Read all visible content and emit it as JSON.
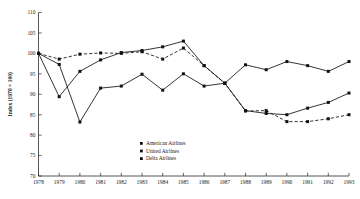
{
  "chart_data": {
    "type": "line",
    "title": "",
    "xlabel": "",
    "ylabel": "Index (1978 = 100)",
    "ylim": [
      70,
      110
    ],
    "ytick_step": 5,
    "yticks": [
      70,
      75,
      80,
      85,
      90,
      95,
      100,
      105,
      110
    ],
    "grid": false,
    "legend_position": "inside-bottom-center",
    "categories": [
      "1978",
      "1979",
      "1980",
      "1981",
      "1982",
      "1983",
      "1984",
      "1985",
      "1986",
      "1987",
      "1988",
      "1989",
      "1990",
      "1991",
      "1992",
      "1993"
    ],
    "x": [
      1978,
      1979,
      1980,
      1981,
      1982,
      1983,
      1984,
      1985,
      1986,
      1987,
      1988,
      1989,
      1990,
      1991,
      1992,
      1993
    ],
    "series": [
      {
        "name": "American Airlines",
        "marker": "square",
        "linestyle": "solid",
        "color": "#111111",
        "values": [
          100.0,
          89.4,
          95.6,
          98.4,
          100.2,
          100.7,
          101.6,
          103.0,
          97.0,
          92.7,
          97.2,
          96.0,
          98.0,
          97.0,
          95.6,
          98.0
        ]
      },
      {
        "name": "United Airlines",
        "marker": "square",
        "linestyle": "solid",
        "color": "#111111",
        "values": [
          100.0,
          97.3,
          83.2,
          91.5,
          92.0,
          94.9,
          91.0,
          95.0,
          92.0,
          92.7,
          86.0,
          85.3,
          85.0,
          86.6,
          88.0,
          90.3
        ]
      },
      {
        "name": "Delta Airlines",
        "marker": "square",
        "linestyle": "dashed",
        "color": "#111111",
        "values": [
          100.0,
          98.6,
          99.8,
          100.1,
          100.0,
          100.4,
          98.6,
          101.3,
          97.0,
          92.7,
          85.9,
          86.0,
          83.3,
          83.3,
          84.0,
          85.0
        ]
      }
    ],
    "legend": [
      "American Airlines",
      "United Airlines",
      "Delta Airlines"
    ]
  }
}
